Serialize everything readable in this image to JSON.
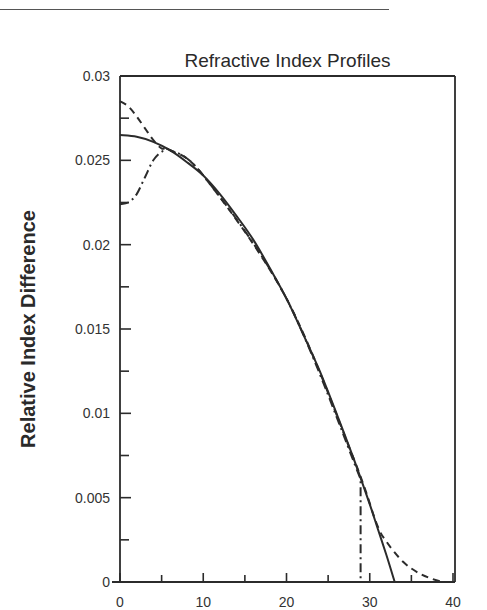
{
  "chart_data": {
    "type": "line",
    "title": "Refractive Index Profiles",
    "xlabel": "",
    "ylabel": "Relative Index Difference",
    "xlim": [
      0,
      40
    ],
    "ylim": [
      0,
      0.03
    ],
    "x_ticks": [
      0,
      10,
      20,
      30,
      40
    ],
    "x_tick_labels": [
      "0",
      "10",
      "20",
      "30",
      "40"
    ],
    "x_minor_ticks": [
      5,
      15,
      25,
      35
    ],
    "y_ticks": [
      0,
      0.005,
      0.01,
      0.015,
      0.02,
      0.025,
      0.03
    ],
    "y_tick_labels": [
      "0",
      "0.005",
      "0.01",
      "0.015",
      "0.02",
      "0.025",
      "0.03"
    ],
    "y_minor_ticks": [
      0.0025,
      0.0075,
      0.0125,
      0.0175,
      0.0225,
      0.0275
    ],
    "grid": false,
    "legend": null,
    "series": [
      {
        "name": "solid profile",
        "style": "solid",
        "x": [
          0,
          2,
          4,
          6,
          8,
          10,
          12,
          14,
          16,
          18,
          20,
          22,
          24,
          26,
          28,
          30,
          31,
          32,
          33
        ],
        "values": [
          0.0265,
          0.0264,
          0.0261,
          0.0256,
          0.0249,
          0.0241,
          0.023,
          0.0217,
          0.0203,
          0.0186,
          0.0168,
          0.0147,
          0.0125,
          0.01,
          0.0074,
          0.0046,
          0.0031,
          0.0016,
          0.0
        ]
      },
      {
        "name": "dashed profile",
        "style": "dashed",
        "x": [
          0,
          1,
          2,
          3,
          4,
          5,
          6,
          10,
          20,
          28,
          30.8,
          32,
          34,
          36,
          38,
          39
        ],
        "values": [
          0.0285,
          0.0282,
          0.0276,
          0.0269,
          0.0262,
          0.0257,
          0.0256,
          0.0241,
          0.0168,
          0.0074,
          0.0035,
          0.0024,
          0.0012,
          0.0005,
          0.0001,
          0.0
        ]
      },
      {
        "name": "dash-dot profile",
        "style": "dash-dot",
        "x": [
          0,
          1,
          2,
          3,
          4,
          5,
          6,
          10,
          20,
          28.9,
          28.9
        ],
        "values": [
          0.0224,
          0.0225,
          0.023,
          0.024,
          0.025,
          0.0255,
          0.0256,
          0.0241,
          0.0168,
          0.0061,
          0.0
        ]
      }
    ]
  }
}
